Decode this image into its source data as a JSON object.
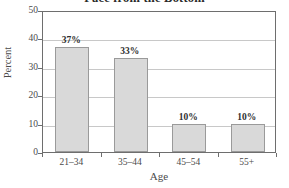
{
  "chart_data": {
    "type": "bar",
    "title": "Face from the Bottom",
    "xlabel": "Age",
    "ylabel": "Percent",
    "categories": [
      "21–34",
      "35–44",
      "45–54",
      "55+"
    ],
    "values": [
      37,
      33,
      10,
      10
    ],
    "data_labels": [
      "37%",
      "33%",
      "10%",
      "10%"
    ],
    "ylim": [
      0,
      50
    ],
    "yticks": [
      0,
      10,
      20,
      30,
      40,
      50
    ],
    "ytick_labels": [
      "0",
      "10",
      "20",
      "30",
      "40",
      "50"
    ],
    "grid": "horizontal",
    "legend": "none",
    "bar_fill_color": "#d9d9d9",
    "bar_border_color": "#9a9a9a",
    "gridline_color": "#c8c8c8",
    "axis_color": "#6e6e6e",
    "background_color": "#ffffff"
  }
}
